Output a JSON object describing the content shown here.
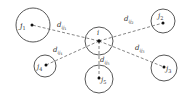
{
  "diagram": {
    "colors": {
      "stroke": "#444444",
      "line": "#666666",
      "text": "#333333",
      "background": "#ffffff"
    },
    "center": {
      "label": "i",
      "cx": 99,
      "cy": 41,
      "r": 14
    },
    "nodes": [
      {
        "id": "j1",
        "label": "j",
        "sub": "1",
        "cx": 33,
        "cy": 25,
        "r": 17,
        "dot": [
          32,
          25
        ]
      },
      {
        "id": "j2",
        "label": "j",
        "sub": "2",
        "cx": 163,
        "cy": 21,
        "r": 12,
        "dot": [
          163,
          23
        ]
      },
      {
        "id": "j3",
        "label": "j",
        "sub": "3",
        "cx": 164,
        "cy": 68,
        "r": 13,
        "dot": [
          164,
          67
        ]
      },
      {
        "id": "j4",
        "label": "j",
        "sub": "4",
        "cx": 45,
        "cy": 66,
        "r": 11,
        "dot": [
          46,
          65
        ]
      },
      {
        "id": "j5",
        "label": "j",
        "sub": "5",
        "cx": 99,
        "cy": 79,
        "r": 14,
        "dot": [
          99,
          78
        ]
      }
    ],
    "edges": [
      {
        "label": "d",
        "sub": "ij",
        "subsub": "1",
        "lx": 57,
        "ly": 29
      },
      {
        "label": "d",
        "sub": "ij",
        "subsub": "2",
        "lx": 124,
        "ly": 23
      },
      {
        "label": "d",
        "sub": "ij",
        "subsub": "3",
        "lx": 135,
        "ly": 52
      },
      {
        "label": "d",
        "sub": "ij",
        "subsub": "4",
        "lx": 53,
        "ly": 53
      },
      {
        "label": "d",
        "sub": "ij",
        "subsub": "5",
        "lx": 101,
        "ly": 63
      }
    ]
  }
}
